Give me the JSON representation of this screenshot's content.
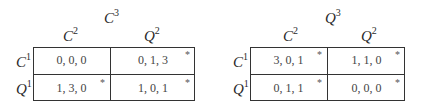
{
  "games": [
    {
      "player3": {
        "base": "C",
        "sup": "3"
      },
      "columns": [
        {
          "base": "C",
          "sup": "2"
        },
        {
          "base": "Q",
          "sup": "2"
        }
      ],
      "rows": [
        {
          "base": "C",
          "sup": "1"
        },
        {
          "base": "Q",
          "sup": "1"
        }
      ],
      "cells": [
        [
          {
            "payoff": "0, 0, 0",
            "star": ""
          },
          {
            "payoff": "0, 1, 3",
            "star": "*"
          }
        ],
        [
          {
            "payoff": "1, 3, 0",
            "star": "*"
          },
          {
            "payoff": "1, 0, 1",
            "star": "*"
          }
        ]
      ]
    },
    {
      "player3": {
        "base": "Q",
        "sup": "3"
      },
      "columns": [
        {
          "base": "C",
          "sup": "2"
        },
        {
          "base": "Q",
          "sup": "2"
        }
      ],
      "rows": [
        {
          "base": "C",
          "sup": "1"
        },
        {
          "base": "Q",
          "sup": "1"
        }
      ],
      "cells": [
        [
          {
            "payoff": "3, 0, 1",
            "star": "*"
          },
          {
            "payoff": "1, 1, 0",
            "star": "*"
          }
        ],
        [
          {
            "payoff": "0, 1, 1",
            "star": "*"
          },
          {
            "payoff": "0, 0, 0",
            "star": "*"
          }
        ]
      ]
    }
  ]
}
